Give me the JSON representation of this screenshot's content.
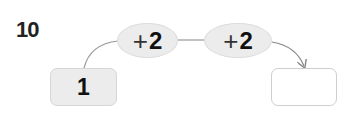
{
  "problem": {
    "number": "10"
  },
  "operations": [
    {
      "sign": "+",
      "value": "2"
    },
    {
      "sign": "+",
      "value": "2"
    }
  ],
  "start_box": {
    "value": "1"
  },
  "answer_box": {
    "value": ""
  },
  "colors": {
    "fill": "#ececec",
    "line": "#999999",
    "text": "#111111"
  }
}
